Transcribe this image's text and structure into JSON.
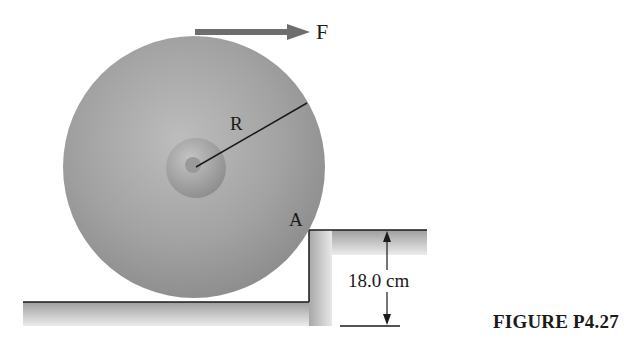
{
  "figure": {
    "caption": "FIGURE P4.27",
    "labels": {
      "force": "F",
      "radius": "R",
      "contact_point": "A",
      "step_height": "18.0 cm"
    },
    "colors": {
      "wheel": "#9a9a9a",
      "force_arrow": "#6e6e6e",
      "ground": "#c8c8c8",
      "line": "#1a1a1a"
    }
  }
}
